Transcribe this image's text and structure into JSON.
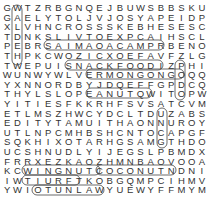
{
  "puzzle": {
    "type": "word-search",
    "rows": 20,
    "cols": 20,
    "grid": [
      "GWTZRBGNQEJBUWSBBSKU",
      "GAELYTOLJVJOSYAPEIDP",
      "XLVHNCROSSSKEBHESESC",
      "TDNKSLIVTOEXPCAIHSCL",
      "PEBRSAIMAOACAMPRBENO",
      "THPKCWOZICXOEFAVFZLG",
      "TWEPUISNACKFOODIZPHI",
      "WUNWYWLVERMONGONGOQQ",
      "YXNNORDBYJDQEFFGPDCQ",
      "THYLSLOPEANUTQWITOPW",
      "YITIESFKKRHFSVSATCVM",
      "ETLMSZHWCYDCLTDUZABS",
      "EDITYTAMUITHAONNUROY",
      "UTLNPCMHBSHCNTOCAPGF",
      "SQKHIXOTARHGSAMGTHDO",
      "UCSHNUDLYIJEGSLPBMDX",
      "FRRXEZKAOZHMNBAOVOOA",
      "KCWINGNUTCOCONUTNDNI",
      "IWTIURFTKOBGQMPCIHMVO",
      "YWIOTUNLAWYUEWYFFMYM"
    ],
    "found_words": [
      "SAIMAACAMP",
      "MONGONGO",
      "PEANUT",
      "SNACKFOOD",
      "WINGNUT",
      "COCONUT",
      "TIURF",
      "TUNLAW"
    ]
  }
}
